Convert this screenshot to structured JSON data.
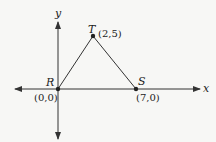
{
  "diagram": {
    "type": "coordinate-geometry",
    "axes": {
      "x_label": "x",
      "y_label": "y"
    },
    "points": [
      {
        "name": "R",
        "coords": "(0,0)"
      },
      {
        "name": "S",
        "coords": "(7,0)"
      },
      {
        "name": "T",
        "coords": "(2,5)"
      }
    ],
    "segments": [
      {
        "from": "R",
        "to": "T"
      },
      {
        "from": "T",
        "to": "S"
      }
    ],
    "colors": {
      "stroke": "#333333",
      "background": "#f7f7f5"
    }
  }
}
